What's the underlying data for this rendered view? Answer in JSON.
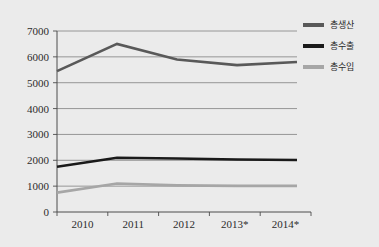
{
  "faint_header": "",
  "legend": {
    "position": "right-top",
    "entries": [
      {
        "label": "총생산",
        "color": "#595959",
        "name": "legend-item-production"
      },
      {
        "label": "총수출",
        "color": "#1a1a1a",
        "name": "legend-item-exports"
      },
      {
        "label": "총수입",
        "color": "#a6a6a6",
        "name": "legend-item-imports"
      }
    ]
  },
  "axes": {
    "y_ticks": [
      "0",
      "1000",
      "2000",
      "3000",
      "4000",
      "5000",
      "6000",
      "7000"
    ],
    "x_ticks": [
      "2010",
      "2011",
      "2012",
      "2013*",
      "2014*"
    ]
  },
  "chart_data": {
    "type": "line",
    "title": "",
    "subtitle": "",
    "xlabel": "",
    "ylabel": "",
    "categories": [
      "2010",
      "2011",
      "2012",
      "2013*",
      "2014*"
    ],
    "ylim": [
      0,
      7000
    ],
    "ytick_step": 1000,
    "grid": true,
    "legend_position": "right-top",
    "series": [
      {
        "name": "총생산",
        "color": "#595959",
        "width": 2.6,
        "values": [
          5450,
          6500,
          5900,
          5680,
          5800
        ]
      },
      {
        "name": "총수출",
        "color": "#1a1a1a",
        "width": 2.6,
        "values": [
          1750,
          2100,
          2070,
          2030,
          2010
        ]
      },
      {
        "name": "총수입",
        "color": "#a6a6a6",
        "width": 2.6,
        "values": [
          750,
          1100,
          1030,
          1010,
          1010
        ]
      }
    ]
  },
  "plot_geometry": {
    "left": 57,
    "right": 297,
    "top": 31,
    "bottom": 212
  }
}
